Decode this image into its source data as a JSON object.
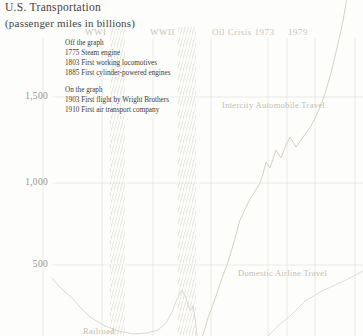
{
  "header": {
    "title": "U.S. Transportation",
    "subtitle": "(passenger miles in billions)"
  },
  "annotations": {
    "off_graph": {
      "heading": "Off the graph",
      "items": [
        "1775 Steam engine",
        "1803 First working locomotives",
        "1885 First cylinder-powered engines"
      ]
    },
    "on_graph": {
      "heading": "On the graph",
      "items": [
        "1903 First flight by Wright Brothers",
        "1910 First air transport company"
      ]
    }
  },
  "chart_data": {
    "type": "line",
    "title": "U.S. Transportation",
    "subtitle": "(passenger miles in billions)",
    "ylabel": "passenger miles (billions)",
    "x_axis": {
      "tick_labels_visible": false,
      "implied_range_years": [
        1890,
        2000
      ]
    },
    "y_axis": {
      "unit": "billions of passenger miles",
      "ticks": [
        {
          "value": 1500,
          "label": "1,500",
          "y_px": 97
        },
        {
          "value": 1000,
          "label": "1,000",
          "y_px": 183
        },
        {
          "value": 500,
          "label": "500",
          "y_px": 265
        }
      ],
      "zero_y_px": 349,
      "note": "zero line falls below the visible crop; bottom edge of image is approximately 78 billion"
    },
    "grid": {
      "x_px": [
        43,
        102,
        153,
        211,
        268,
        287,
        315,
        355
      ],
      "y_px": [
        97,
        183,
        265
      ]
    },
    "event_bands": [
      {
        "label": "WWI",
        "label_px": {
          "x": 85,
          "y": 27
        },
        "band_x_px": [
          110,
          125
        ]
      },
      {
        "label": "WWII",
        "label_px": {
          "x": 150,
          "y": 27
        },
        "band_x_px": [
          178,
          196
        ]
      }
    ],
    "event_lines": [
      {
        "label": "Oil Crisis 1973",
        "label_px": {
          "x": 212,
          "y": 27
        },
        "gridline_x_px": 268
      },
      {
        "label": "1979",
        "label_px": {
          "x": 288,
          "y": 27
        },
        "gridline_x_px": 287
      }
    ],
    "series": [
      {
        "name": "Railroad",
        "color": "#d8d5d0",
        "label_px": {
          "x": 83,
          "y": 326
        },
        "points_px": [
          [
            52,
            278
          ],
          [
            58,
            285
          ],
          [
            65,
            292
          ],
          [
            72,
            298
          ],
          [
            80,
            307
          ],
          [
            90,
            317
          ],
          [
            103,
            325
          ],
          [
            118,
            331
          ],
          [
            133,
            334
          ],
          [
            147,
            333
          ],
          [
            158,
            330
          ],
          [
            166,
            323
          ],
          [
            172,
            312
          ],
          [
            177,
            299
          ],
          [
            182,
            290
          ],
          [
            186,
            298
          ],
          [
            190,
            311
          ],
          [
            193,
            306
          ],
          [
            195,
            318
          ],
          [
            197,
            335
          ],
          [
            199,
            340
          ]
        ],
        "estimated_points": [
          {
            "year": 1895,
            "value": 423
          },
          {
            "year": 1900,
            "value": 381
          },
          {
            "year": 1905,
            "value": 304
          },
          {
            "year": 1912,
            "value": 190
          },
          {
            "year": 1917,
            "value": 143
          },
          {
            "year": 1922,
            "value": 107
          },
          {
            "year": 1927,
            "value": 89
          },
          {
            "year": 1931,
            "value": 95
          },
          {
            "year": 1935,
            "value": 155
          },
          {
            "year": 1939,
            "value": 220
          },
          {
            "year": 1943,
            "value": 351
          },
          {
            "year": 1946,
            "value": 226
          },
          {
            "year": 1948,
            "value": 185
          },
          {
            "year": 1950,
            "value": 83
          }
        ]
      },
      {
        "name": "Domestic Airline Travel",
        "color": "#dcd9d2",
        "label_px": {
          "x": 238,
          "y": 268
        },
        "points_px": [
          [
            266,
            338
          ],
          [
            278,
            326
          ],
          [
            290,
            316
          ],
          [
            298,
            308
          ],
          [
            305,
            301
          ],
          [
            312,
            297
          ],
          [
            322,
            291
          ],
          [
            335,
            285
          ],
          [
            348,
            279
          ],
          [
            363,
            271
          ]
        ],
        "estimated_points": [
          {
            "year": 1972,
            "value": 70
          },
          {
            "year": 1976,
            "value": 137
          },
          {
            "year": 1980,
            "value": 196
          },
          {
            "year": 1983,
            "value": 244
          },
          {
            "year": 1987,
            "value": 310
          },
          {
            "year": 1990,
            "value": 345
          },
          {
            "year": 1994,
            "value": 381
          },
          {
            "year": 1998,
            "value": 417
          },
          {
            "year": 2003,
            "value": 464
          }
        ]
      },
      {
        "name": "Intercity Automobile Travel",
        "color": "#d2ccbf",
        "label_px": {
          "x": 222,
          "y": 100
        },
        "points_px": [
          [
            202,
            338
          ],
          [
            208,
            318
          ],
          [
            214,
            302
          ],
          [
            222,
            278
          ],
          [
            227,
            265
          ],
          [
            234,
            242
          ],
          [
            240,
            220
          ],
          [
            249,
            201
          ],
          [
            260,
            183
          ],
          [
            263,
            174
          ],
          [
            266,
            162
          ],
          [
            270,
            168
          ],
          [
            276,
            150
          ],
          [
            281,
            158
          ],
          [
            286,
            145
          ],
          [
            290,
            137
          ],
          [
            296,
            147
          ],
          [
            301,
            140
          ],
          [
            306,
            133
          ],
          [
            311,
            126
          ],
          [
            317,
            114
          ],
          [
            324,
            97
          ],
          [
            331,
            73
          ],
          [
            337,
            48
          ],
          [
            343,
            21
          ],
          [
            347,
            -3
          ]
        ],
        "estimated_points": [
          {
            "year": 1947,
            "value": 65
          },
          {
            "year": 1952,
            "value": 280
          },
          {
            "year": 1957,
            "value": 500
          },
          {
            "year": 1962,
            "value": 768
          },
          {
            "year": 1966,
            "value": 880
          },
          {
            "year": 1970,
            "value": 988
          },
          {
            "year": 1972,
            "value": 1113
          },
          {
            "year": 1974,
            "value": 1077
          },
          {
            "year": 1976,
            "value": 1185
          },
          {
            "year": 1978,
            "value": 1137
          },
          {
            "year": 1980,
            "value": 1262
          },
          {
            "year": 1982,
            "value": 1202
          },
          {
            "year": 1986,
            "value": 1399
          },
          {
            "year": 1990,
            "value": 1494
          },
          {
            "year": 1994,
            "value": 1792
          },
          {
            "year": 1998,
            "value": 2077
          }
        ]
      }
    ],
    "style": {
      "grid_color": "#e3e2de",
      "hatch_color": "#dbd8d3",
      "background": "#fdfdfb",
      "title_color": "#45423c",
      "annotation_color": "#3e3b35",
      "axis_label_color": "#97948e",
      "era_label_color": "#c9c3b5",
      "series_label_color": "#c3bdb0"
    },
    "legend_position": "labels-on-chart",
    "grid_on": true
  }
}
